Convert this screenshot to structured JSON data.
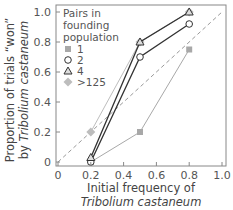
{
  "chart_data": {
    "type": "line",
    "title": "",
    "xlabel": "Initial frequency of Tribolium castaneum",
    "xlabel_lines": [
      "Initial frequency of",
      "Tribolium castaneum"
    ],
    "ylabel": "Proportion of trials \"won\" by Tribolium castaneum",
    "ylabel_lines": [
      "Proportion of trials “won”",
      "by Tribolium castaneum"
    ],
    "xlim": [
      0,
      1.0
    ],
    "ylim": [
      0,
      1.0
    ],
    "xticks": [
      "0",
      "0.2",
      "0.4",
      "0.6",
      "0.8",
      "1.0"
    ],
    "yticks": [
      "0",
      "0.2",
      "0.4",
      "0.6",
      "0.8",
      "1.0"
    ],
    "grid": false,
    "reference_line": {
      "style": "dashed",
      "from": [
        0,
        0
      ],
      "to": [
        1,
        1
      ],
      "color": "#9a9a9a"
    },
    "legend": {
      "title_lines": [
        "Pairs in",
        "founding",
        "population"
      ],
      "position": "upper-left"
    },
    "x": [
      0.2,
      0.5,
      0.8
    ],
    "series": [
      {
        "name": "1",
        "marker": "square",
        "color": "#a8a8a8",
        "values": [
          0.0,
          0.2,
          0.75
        ]
      },
      {
        "name": "2",
        "marker": "circle",
        "color": "#333333",
        "values": [
          0.0,
          0.7,
          0.92
        ]
      },
      {
        "name": "4",
        "marker": "triangle",
        "color": "#333333",
        "values": [
          0.03,
          0.8,
          1.0
        ]
      },
      {
        "name": ">125",
        "marker": "diamond",
        "color": "#bdbdbd",
        "values": [
          0.2,
          0.8,
          1.0
        ]
      }
    ]
  }
}
